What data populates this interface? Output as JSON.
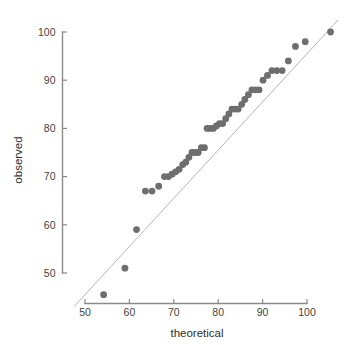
{
  "chart_data": {
    "type": "scatter",
    "title": "",
    "xlabel": "theoretical",
    "ylabel": "observed",
    "xlim": [
      46,
      108
    ],
    "ylim": [
      42,
      103
    ],
    "xticks": [
      50,
      60,
      70,
      80,
      90,
      100
    ],
    "yticks": [
      50,
      60,
      70,
      80,
      90,
      100
    ],
    "xtick_labels": [
      "50",
      "60",
      "70",
      "80",
      "90",
      "100"
    ],
    "ytick_labels": [
      "50",
      "60",
      "70",
      "80",
      "90",
      "100"
    ],
    "grid": false,
    "legend": false,
    "series": [
      {
        "name": "quantiles",
        "marker": "circle",
        "color": "#6e6e6e",
        "marker_size": 3.4,
        "points": [
          [
            54.2,
            45.5
          ],
          [
            59.0,
            51.0
          ],
          [
            61.6,
            59.0
          ],
          [
            63.6,
            67.0
          ],
          [
            65.1,
            67.0
          ],
          [
            66.6,
            68.0
          ],
          [
            67.9,
            70.0
          ],
          [
            68.8,
            70.0
          ],
          [
            69.6,
            70.5
          ],
          [
            70.4,
            71.0
          ],
          [
            71.2,
            71.5
          ],
          [
            72.0,
            72.5
          ],
          [
            72.7,
            73.0
          ],
          [
            73.4,
            74.0
          ],
          [
            74.1,
            75.0
          ],
          [
            74.8,
            75.0
          ],
          [
            75.5,
            75.0
          ],
          [
            76.2,
            76.0
          ],
          [
            76.9,
            76.0
          ],
          [
            77.5,
            80.0
          ],
          [
            78.2,
            80.0
          ],
          [
            78.9,
            80.0
          ],
          [
            79.6,
            80.5
          ],
          [
            80.3,
            81.0
          ],
          [
            81.0,
            81.0
          ],
          [
            81.7,
            82.0
          ],
          [
            82.4,
            83.0
          ],
          [
            83.1,
            84.0
          ],
          [
            83.8,
            84.0
          ],
          [
            84.5,
            84.0
          ],
          [
            85.3,
            85.0
          ],
          [
            86.0,
            86.0
          ],
          [
            86.8,
            87.0
          ],
          [
            87.6,
            88.0
          ],
          [
            88.4,
            88.0
          ],
          [
            89.2,
            88.0
          ],
          [
            90.1,
            90.0
          ],
          [
            91.1,
            91.0
          ],
          [
            92.1,
            92.0
          ],
          [
            93.2,
            92.0
          ],
          [
            94.4,
            92.0
          ],
          [
            95.8,
            94.0
          ],
          [
            97.4,
            97.0
          ],
          [
            99.6,
            98.0
          ],
          [
            105.3,
            100.0
          ]
        ]
      }
    ],
    "reference_line": {
      "name": "identity-line",
      "color": "#b6b6b6",
      "slope": 1,
      "intercept": 0,
      "from": [
        47.5,
        43.0
      ],
      "to": [
        107.0,
        102.5
      ]
    }
  },
  "axes": {
    "x_axis_name": "theoretical-axis",
    "y_axis_name": "observed-axis"
  }
}
